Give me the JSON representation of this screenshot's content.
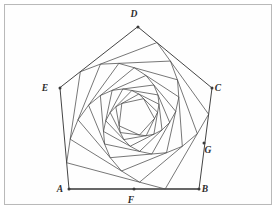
{
  "figure": {
    "background_color": "#ffffff",
    "frame_color": "#b9b9b9",
    "line_color": "#4a4a4a",
    "label_color": "#2b2b2b",
    "shape_type": "pentagon",
    "nested_count": 11,
    "rotation_direction": "inward-clockwise",
    "edge_ratio": 0.26,
    "center": {
      "x": 139.0,
      "y": 110.0
    },
    "labels": [
      {
        "name": "A",
        "text": "A",
        "x": 69.0,
        "y": 189.0,
        "label_x": 60.0,
        "label_y": 192.0
      },
      {
        "name": "B",
        "text": "B",
        "x": 199.0,
        "y": 189.0,
        "label_x": 205.0,
        "label_y": 192.0
      },
      {
        "name": "C",
        "text": "C",
        "x": 212.0,
        "y": 88.0,
        "label_x": 218.0,
        "label_y": 91.0
      },
      {
        "name": "D",
        "text": "D",
        "x": 138.0,
        "y": 27.0,
        "label_x": 134.0,
        "label_y": 17.0
      },
      {
        "name": "E",
        "text": "E",
        "x": 60.0,
        "y": 88.0,
        "label_x": 45.0,
        "label_y": 91.0
      },
      {
        "name": "F",
        "text": "F",
        "x": 134.0,
        "y": 189.0,
        "label_x": 131.0,
        "label_y": 203.0
      },
      {
        "name": "G",
        "text": "G",
        "x": 204.0,
        "y": 143.0,
        "label_x": 208.0,
        "label_y": 153.0
      }
    ],
    "outer_vertices": [
      {
        "name": "D",
        "x": 138.0,
        "y": 27.0
      },
      {
        "name": "C",
        "x": 212.0,
        "y": 88.0
      },
      {
        "name": "B",
        "x": 199.0,
        "y": 189.0
      },
      {
        "name": "A",
        "x": 69.0,
        "y": 189.0
      },
      {
        "name": "E",
        "x": 60.0,
        "y": 88.0
      }
    ],
    "base_edge": {
      "name": "AB",
      "x1": 69.0,
      "y1": 189.0,
      "x2": 199.0,
      "y2": 189.0
    },
    "marked_points": [
      {
        "name": "F",
        "on_edge": "AB",
        "x": 134.0,
        "y": 189.0
      },
      {
        "name": "G",
        "on_edge": "CB",
        "x": 204.0,
        "y": 143.0
      }
    ]
  }
}
